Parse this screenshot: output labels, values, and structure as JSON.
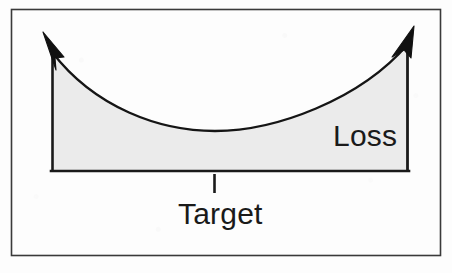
{
  "figure": {
    "type": "diagram",
    "frame": {
      "name": "outer-frame",
      "stroke_color": "#3a3a3a",
      "x": 11,
      "y": 9,
      "width": 430,
      "height": 247
    },
    "region": {
      "name": "loss-area",
      "fill_color": "#ebebeb",
      "stroke_color": "#1a1a1a"
    },
    "axes": {
      "left_axis": {
        "x": 52,
        "y_top": 48,
        "y_bottom": 171
      },
      "right_axis": {
        "x": 408,
        "y_top": 40,
        "y_bottom": 171
      },
      "baseline": {
        "y": 171,
        "x_start": 52,
        "x_end": 408
      }
    },
    "arrows": [
      {
        "name": "left-arrow-head",
        "tip_x": 44,
        "tip_y": 33,
        "direction": "up-left"
      },
      {
        "name": "right-arrow-head",
        "tip_x": 413,
        "tip_y": 27,
        "direction": "up-right"
      }
    ],
    "curve": {
      "name": "loss-curve",
      "shape": "u-curve",
      "start": [
        52,
        52
      ],
      "minimum": [
        215,
        131
      ],
      "end": [
        408,
        44
      ],
      "stroke_color": "#151515",
      "stroke_width": 2.2
    },
    "tick": {
      "name": "target-tick",
      "x": 214,
      "y_top": 174,
      "y_bottom": 193,
      "stroke_color": "#1a1a1a"
    }
  },
  "labels": {
    "loss": "Loss",
    "target": "Target"
  }
}
